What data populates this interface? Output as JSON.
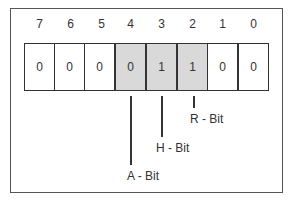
{
  "diagram": {
    "bit_indices": [
      "7",
      "6",
      "5",
      "4",
      "3",
      "2",
      "1",
      "0"
    ],
    "bit_values": [
      "0",
      "0",
      "0",
      "0",
      "1",
      "1",
      "0",
      "0"
    ],
    "highlighted_bits": [
      4,
      3,
      2
    ],
    "highlight_color": "#d9d9d9",
    "labels": [
      {
        "bit": 4,
        "text": "A - Bit"
      },
      {
        "bit": 3,
        "text": "H - Bit"
      },
      {
        "bit": 2,
        "text": "R - Bit"
      }
    ]
  }
}
